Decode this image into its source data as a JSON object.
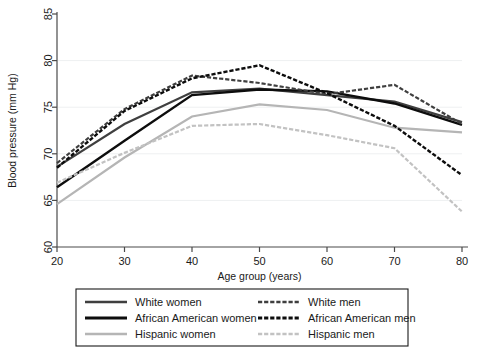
{
  "chart_data": {
    "type": "line",
    "title": "",
    "xlabel": "Age group (years)",
    "ylabel": "Blood pressure (mm Hg)",
    "x": [
      20,
      30,
      40,
      50,
      60,
      70,
      80
    ],
    "xlim": [
      20,
      80
    ],
    "ylim": [
      60,
      85
    ],
    "xticks": [
      "20",
      "30",
      "40",
      "50",
      "60",
      "70",
      "80"
    ],
    "yticks": [
      "60",
      "65",
      "70",
      "75",
      "80",
      "85"
    ],
    "grid": "horizontal",
    "gridline_values": [
      65,
      70,
      75,
      80
    ],
    "legend_position": "below-outside",
    "legend_columns": 2,
    "series": [
      {
        "name": "White women",
        "style": "solid",
        "color": "#3f3f3f",
        "width": 2.2,
        "values": [
          68.6,
          73.2,
          76.6,
          77.0,
          76.3,
          75.6,
          73.4
        ]
      },
      {
        "name": "African American women",
        "style": "solid",
        "color": "#0d0d0d",
        "width": 2.4,
        "values": [
          66.4,
          71.4,
          76.3,
          76.9,
          76.7,
          75.4,
          73.1
        ]
      },
      {
        "name": "Hispanic women",
        "style": "solid",
        "color": "#b5b5b5",
        "width": 2.2,
        "values": [
          64.6,
          69.6,
          74.0,
          75.3,
          74.7,
          72.8,
          72.3
        ]
      },
      {
        "name": "White men",
        "style": "dashed",
        "color": "#3f3f3f",
        "width": 2.2,
        "values": [
          69.0,
          74.8,
          78.4,
          77.6,
          76.4,
          77.4,
          73.2
        ]
      },
      {
        "name": "African American men",
        "style": "dashed",
        "color": "#0d0d0d",
        "width": 2.4,
        "values": [
          68.5,
          74.6,
          78.1,
          79.5,
          76.5,
          73.0,
          67.7
        ]
      },
      {
        "name": "Hispanic men",
        "style": "dashed",
        "color": "#c2c2c2",
        "width": 2.2,
        "values": [
          66.9,
          70.1,
          73.0,
          73.2,
          72.0,
          70.6,
          63.8
        ]
      }
    ]
  },
  "legend": {
    "entries": [
      {
        "label": "White women",
        "column": 0,
        "row": 0
      },
      {
        "label": "African American women",
        "column": 0,
        "row": 1
      },
      {
        "label": "Hispanic women",
        "column": 0,
        "row": 2
      },
      {
        "label": "White men",
        "column": 1,
        "row": 0
      },
      {
        "label": "African American men",
        "column": 1,
        "row": 1
      },
      {
        "label": "Hispanic men",
        "column": 1,
        "row": 2
      }
    ]
  }
}
